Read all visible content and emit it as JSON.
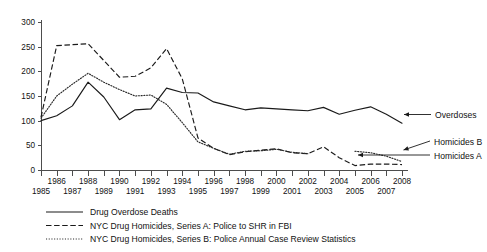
{
  "chart_data": {
    "type": "line",
    "title": "",
    "subtitle": "",
    "xlabel": "",
    "ylabel": "",
    "xlim": [
      1985,
      2008
    ],
    "ylim": [
      0,
      300
    ],
    "yticks": [
      0,
      50,
      100,
      150,
      200,
      250,
      300
    ],
    "grid": false,
    "legend_position": "below",
    "x": [
      1985,
      1986,
      1987,
      1988,
      1989,
      1990,
      1991,
      1992,
      1993,
      1994,
      1995,
      1996,
      1997,
      1998,
      1999,
      2000,
      2001,
      2002,
      2003,
      2004,
      2005,
      2006,
      2007,
      2008
    ],
    "xtick_labels": [
      "1985",
      "1986",
      "1987",
      "1988",
      "1989",
      "1990",
      "1991",
      "1992",
      "1993",
      "1994",
      "1995",
      "1996",
      "1997",
      "1998",
      "1999",
      "2000",
      "2001",
      "2002",
      "2003",
      "2004",
      "2005",
      "2006",
      "2007",
      "2008"
    ],
    "ytick_labels": [
      "0",
      "50",
      "100",
      "150",
      "200",
      "250",
      "300"
    ],
    "series": [
      {
        "name": "Drug Overdose Deaths",
        "style": "solid",
        "annotation": "Overdoses",
        "values": [
          100,
          110,
          130,
          178,
          148,
          102,
          122,
          124,
          166,
          157,
          156,
          138,
          130,
          122,
          126,
          124,
          122,
          120,
          127,
          113,
          121,
          128,
          113,
          95
        ]
      },
      {
        "name": "NYC Drug Homicides, Series A: Police to SHR in FBI",
        "style": "dashed",
        "annotation": "Homicides A",
        "values": [
          107,
          252,
          254,
          256,
          222,
          188,
          190,
          207,
          246,
          185,
          65,
          44,
          31,
          37,
          40,
          43,
          35,
          33,
          47,
          25,
          9,
          12,
          12,
          11
        ]
      },
      {
        "name": "NYC Drug Homicides, Series B: Police Annual Case Review Statistics",
        "style": "dotted",
        "annotation": "Homicides B",
        "values": [
          105,
          150,
          174,
          196,
          178,
          163,
          150,
          152,
          133,
          96,
          57,
          44,
          32,
          38,
          39,
          42,
          36,
          33,
          null,
          null,
          38,
          35,
          28,
          17
        ]
      }
    ],
    "annotations": [
      {
        "text": "Overdoses",
        "series": "Drug Overdose Deaths"
      },
      {
        "text": "Homicides B",
        "series": "NYC Drug Homicides, Series B: Police Annual Case Review Statistics"
      },
      {
        "text": "Homicides A",
        "series": "NYC Drug Homicides, Series A: Police to SHR in FBI"
      }
    ],
    "legend": [
      {
        "label": "Drug Overdose Deaths",
        "style": "solid"
      },
      {
        "label": "NYC Drug Homicides, Series A: Police to SHR in FBI",
        "style": "dashed"
      },
      {
        "label": "NYC Drug Homicides, Series B: Police Annual Case Review Statistics",
        "style": "dotted"
      }
    ],
    "colors": {
      "line": "#1a1a1a",
      "axis": "#4d4d4d",
      "background": "#ffffff"
    }
  }
}
